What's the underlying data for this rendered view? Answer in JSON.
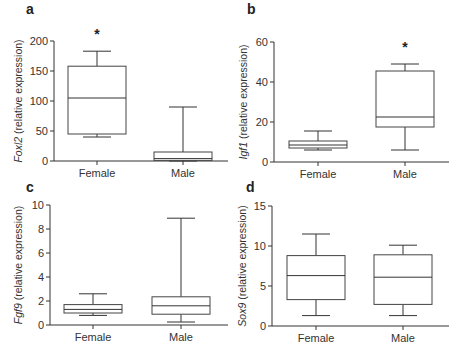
{
  "chart_data": [
    {
      "panel": "a",
      "type": "box",
      "gene": "Foxl2",
      "ylabel": "Foxl2 (relative expression)",
      "ylabel_italic": "Foxl2",
      "ylabel_rest": " (relative expression)",
      "ylim": [
        0,
        200
      ],
      "yticks": [
        0,
        50,
        100,
        150,
        200
      ],
      "categories": [
        "Female",
        "Male"
      ],
      "boxes": [
        {
          "name": "Female",
          "min": 40,
          "q1": 45,
          "median": 105,
          "q3": 158,
          "max": 183,
          "significant": true
        },
        {
          "name": "Male",
          "min": 0,
          "q1": 1,
          "median": 4,
          "q3": 15,
          "max": 90,
          "significant": false
        }
      ]
    },
    {
      "panel": "b",
      "type": "box",
      "gene": "Igf1",
      "ylabel": "Igf1 (relative expression)",
      "ylabel_italic": "Igf1",
      "ylabel_rest": " (relative expression)",
      "ylim": [
        0,
        60
      ],
      "yticks": [
        0,
        20,
        40,
        60
      ],
      "categories": [
        "Female",
        "Male"
      ],
      "boxes": [
        {
          "name": "Female",
          "min": 6,
          "q1": 7,
          "median": 8.5,
          "q3": 10.5,
          "max": 15.5,
          "significant": false
        },
        {
          "name": "Male",
          "min": 6,
          "q1": 17.5,
          "median": 22.5,
          "q3": 45.5,
          "max": 49,
          "significant": true
        }
      ]
    },
    {
      "panel": "c",
      "type": "box",
      "gene": "Fgf9",
      "ylabel": "Fgf9 (relative expression)",
      "ylabel_italic": "Fgf9",
      "ylabel_rest": " (relative expression)",
      "ylim": [
        0,
        10
      ],
      "yticks": [
        0,
        2,
        4,
        6,
        8,
        10
      ],
      "categories": [
        "Female",
        "Male"
      ],
      "boxes": [
        {
          "name": "Female",
          "min": 0.8,
          "q1": 1.0,
          "median": 1.3,
          "q3": 1.7,
          "max": 2.6,
          "significant": false
        },
        {
          "name": "Male",
          "min": 0.25,
          "q1": 0.9,
          "median": 1.6,
          "q3": 2.35,
          "max": 8.9,
          "significant": false
        }
      ]
    },
    {
      "panel": "d",
      "type": "box",
      "gene": "Sox9",
      "ylabel": "Sox9 (relative expression)",
      "ylabel_italic": "Sox9",
      "ylabel_rest": " (relative expression)",
      "ylim": [
        0,
        15
      ],
      "yticks": [
        0,
        5,
        10,
        15
      ],
      "categories": [
        "Female",
        "Male"
      ],
      "boxes": [
        {
          "name": "Female",
          "min": 1.3,
          "q1": 3.3,
          "median": 6.3,
          "q3": 8.8,
          "max": 11.5,
          "significant": false
        },
        {
          "name": "Male",
          "min": 1.3,
          "q1": 2.7,
          "median": 6.1,
          "q3": 8.9,
          "max": 10.1,
          "significant": false
        }
      ]
    }
  ],
  "labels": {
    "panel_a": "a",
    "panel_b": "b",
    "panel_c": "c",
    "panel_d": "d",
    "significance_marker": "*"
  }
}
